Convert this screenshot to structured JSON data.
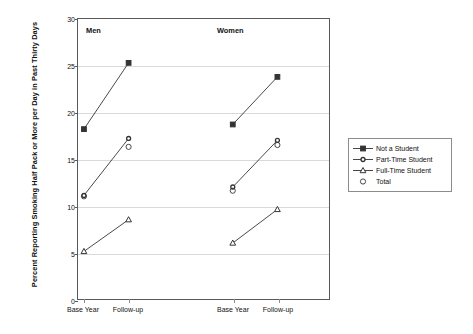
{
  "chart_data": {
    "type": "line",
    "title": "",
    "xlabel": "",
    "ylabel": "Percent Reporting Smoking Half Pack or More per Day in Past Thirty Days",
    "ylim": [
      0,
      30
    ],
    "yticks": [
      0,
      5,
      10,
      15,
      20,
      25,
      30
    ],
    "grid": true,
    "legend_position": "right",
    "panels": [
      {
        "label": "Men",
        "categories": [
          "Base Year",
          "Follow-up"
        ]
      },
      {
        "label": "Women",
        "categories": [
          "Base Year",
          "Follow-up"
        ]
      }
    ],
    "categories": [
      "Base Year",
      "Follow-up",
      "Base Year",
      "Follow-up"
    ],
    "series": [
      {
        "name": "Not a Student",
        "marker": "filled-square",
        "line": true,
        "values": [
          18.2,
          25.3,
          18.7,
          23.8
        ]
      },
      {
        "name": "Part-Time Student",
        "marker": "small-circle",
        "line": true,
        "values": [
          11.1,
          17.2,
          12.0,
          17.0
        ]
      },
      {
        "name": "Full-Time Student",
        "marker": "triangle",
        "line": true,
        "values": [
          5.1,
          8.5,
          6.0,
          9.6
        ]
      },
      {
        "name": "Total",
        "marker": "open-circle",
        "line": false,
        "values": [
          11.0,
          16.3,
          11.6,
          16.5
        ]
      }
    ]
  },
  "yaxis": {
    "title": "Percent Reporting Smoking Half Pack or More per Day in Past Thirty Days",
    "ticks": [
      "0",
      "5",
      "10",
      "15",
      "20",
      "25",
      "30"
    ]
  },
  "xaxis": {
    "ticks": [
      "Base Year",
      "Follow-up",
      "Base Year",
      "Follow-up"
    ]
  },
  "panels": {
    "men": "Men",
    "women": "Women"
  },
  "legend": {
    "items": [
      {
        "label": "Not a Student"
      },
      {
        "label": "Part-Time Student"
      },
      {
        "label": "Full-Time Student"
      },
      {
        "label": "Total"
      }
    ]
  },
  "colors": {
    "series": "#333333",
    "frame": "#595959",
    "grid": "#d9d9d9",
    "text": "#111111"
  }
}
